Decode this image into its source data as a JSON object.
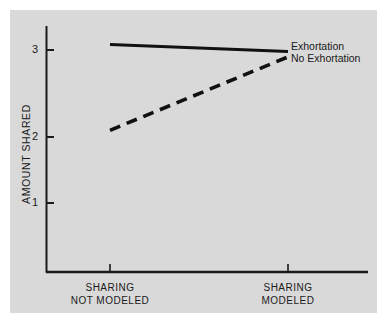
{
  "figure": {
    "background_color": "#ffffff",
    "plate_color": "#d9d9d9",
    "ink_color": "#1a1a1a"
  },
  "axis": {
    "y_label": "AMOUNT SHARED",
    "y_ticks": [
      "3",
      "2",
      "1"
    ],
    "x_categories": [
      {
        "line1": "SHARING",
        "line2": "NOT MODELED"
      },
      {
        "line1": "SHARING",
        "line2": "MODELED"
      }
    ]
  },
  "legend": {
    "items": [
      {
        "label": "Exhortation",
        "style": "solid"
      },
      {
        "label": "No Exhortation",
        "style": "dashed"
      }
    ]
  },
  "chart_data": {
    "type": "line",
    "title": "",
    "xlabel": "",
    "ylabel": "AMOUNT SHARED",
    "categories": [
      "SHARING NOT MODELED",
      "SHARING MODELED"
    ],
    "x": [
      0,
      1
    ],
    "ylim": [
      0.3,
      3.3
    ],
    "yticks": [
      1,
      2,
      3
    ],
    "grid": false,
    "legend_position": "right",
    "series": [
      {
        "name": "Exhortation",
        "style": "solid",
        "values": [
          3.07,
          2.98
        ]
      },
      {
        "name": "No Exhortation",
        "style": "dashed",
        "values": [
          1.95,
          2.91
        ]
      }
    ]
  }
}
